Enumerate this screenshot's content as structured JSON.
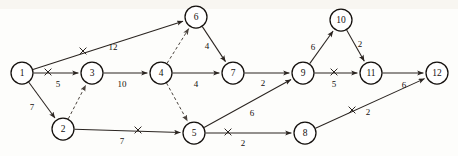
{
  "figure": {
    "background_color": "#fdfdfb",
    "ink_color": "#14100d"
  },
  "chart_data": {
    "type": "diagram",
    "title": "",
    "xlabel": "",
    "ylabel": "",
    "layout": "directed graph with numbered nodes and weighted arcs",
    "nodes": [
      {
        "id": "1",
        "label": "1",
        "x": 22,
        "y": 73,
        "r": 11
      },
      {
        "id": "2",
        "label": "2",
        "x": 63,
        "y": 129,
        "r": 11
      },
      {
        "id": "3",
        "label": "3",
        "x": 92,
        "y": 73,
        "r": 11
      },
      {
        "id": "4",
        "label": "4",
        "x": 161,
        "y": 73,
        "r": 11
      },
      {
        "id": "5",
        "label": "5",
        "x": 194,
        "y": 133,
        "r": 11
      },
      {
        "id": "6",
        "label": "6",
        "x": 196,
        "y": 17,
        "r": 11
      },
      {
        "id": "7",
        "label": "7",
        "x": 233,
        "y": 73,
        "r": 11
      },
      {
        "id": "8",
        "label": "8",
        "x": 305,
        "y": 133,
        "r": 11
      },
      {
        "id": "9",
        "label": "9",
        "x": 303,
        "y": 73,
        "r": 11
      },
      {
        "id": "10",
        "label": "10",
        "x": 341,
        "y": 20,
        "r": 11
      },
      {
        "id": "11",
        "label": "11",
        "x": 371,
        "y": 73,
        "r": 11
      },
      {
        "id": "12",
        "label": "12",
        "x": 437,
        "y": 73,
        "r": 11
      }
    ],
    "edges": [
      {
        "from": "1",
        "to": "6",
        "weight": "12",
        "style": "solid",
        "crossed": true,
        "label_x": 113,
        "label_y": 48,
        "x_mark_x": 83,
        "x_mark_y": 51
      },
      {
        "from": "1",
        "to": "3",
        "weight": "5",
        "style": "solid",
        "crossed": true,
        "label_x": 58,
        "label_y": 85,
        "x_mark_x": 48,
        "x_mark_y": 72
      },
      {
        "from": "1",
        "to": "2",
        "weight": "7",
        "style": "solid",
        "crossed": false,
        "label_x": 32,
        "label_y": 108,
        "x_mark_x": 0,
        "x_mark_y": 0
      },
      {
        "from": "2",
        "to": "3",
        "weight": "",
        "style": "dashed",
        "crossed": false,
        "label_x": 0,
        "label_y": 0,
        "x_mark_x": 0,
        "x_mark_y": 0
      },
      {
        "from": "2",
        "to": "5",
        "weight": "7",
        "style": "solid",
        "crossed": true,
        "label_x": 122,
        "label_y": 142,
        "x_mark_x": 138,
        "x_mark_y": 130
      },
      {
        "from": "3",
        "to": "4",
        "weight": "10",
        "style": "solid",
        "crossed": false,
        "label_x": 122,
        "label_y": 85,
        "x_mark_x": 0,
        "x_mark_y": 0
      },
      {
        "from": "4",
        "to": "6",
        "weight": "",
        "style": "dashed",
        "crossed": false,
        "label_x": 0,
        "label_y": 0,
        "x_mark_x": 0,
        "x_mark_y": 0
      },
      {
        "from": "4",
        "to": "5",
        "weight": "",
        "style": "dashed",
        "crossed": false,
        "label_x": 0,
        "label_y": 0,
        "x_mark_x": 0,
        "x_mark_y": 0
      },
      {
        "from": "4",
        "to": "7",
        "weight": "4",
        "style": "solid",
        "crossed": false,
        "label_x": 196,
        "label_y": 85,
        "x_mark_x": 0,
        "x_mark_y": 0
      },
      {
        "from": "6",
        "to": "7",
        "weight": "4",
        "style": "solid",
        "crossed": false,
        "label_x": 207,
        "label_y": 47,
        "x_mark_x": 0,
        "x_mark_y": 0
      },
      {
        "from": "7",
        "to": "9",
        "weight": "2",
        "style": "solid",
        "crossed": false,
        "label_x": 263,
        "label_y": 84,
        "x_mark_x": 0,
        "x_mark_y": 0
      },
      {
        "from": "5",
        "to": "9",
        "weight": "6",
        "style": "solid",
        "crossed": false,
        "label_x": 252,
        "label_y": 114,
        "x_mark_x": 0,
        "x_mark_y": 0
      },
      {
        "from": "5",
        "to": "8",
        "weight": "2",
        "style": "solid",
        "crossed": true,
        "label_x": 243,
        "label_y": 144,
        "x_mark_x": 228,
        "x_mark_y": 132
      },
      {
        "from": "9",
        "to": "10",
        "weight": "6",
        "style": "solid",
        "crossed": false,
        "label_x": 313,
        "label_y": 48,
        "x_mark_x": 0,
        "x_mark_y": 0
      },
      {
        "from": "10",
        "to": "11",
        "weight": "2",
        "style": "solid",
        "crossed": false,
        "label_x": 360,
        "label_y": 45,
        "x_mark_x": 0,
        "x_mark_y": 0
      },
      {
        "from": "9",
        "to": "11",
        "weight": "5",
        "style": "solid",
        "crossed": true,
        "label_x": 334,
        "label_y": 85,
        "x_mark_x": 334,
        "x_mark_y": 72
      },
      {
        "from": "11",
        "to": "12",
        "weight": "6",
        "style": "solid",
        "crossed": false,
        "label_x": 404,
        "label_y": 86,
        "x_mark_x": 0,
        "x_mark_y": 0
      },
      {
        "from": "8",
        "to": "12",
        "weight": "2",
        "style": "solid",
        "crossed": true,
        "label_x": 368,
        "label_y": 113,
        "x_mark_x": 352,
        "x_mark_y": 110
      }
    ]
  },
  "background_artifacts": {
    "top_text": "",
    "mid_text": "",
    "bottom_text": ""
  }
}
